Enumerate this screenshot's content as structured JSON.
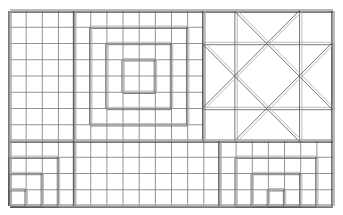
{
  "grid": {
    "cols": 20,
    "rows": 12,
    "x0": 10,
    "y0": 11,
    "cell_w": 16.15,
    "cell_h": 16.25
  },
  "colors": {
    "line": "#555555",
    "light_line": "#aaaaaa",
    "background": "#ffffff"
  },
  "blocks": [
    {
      "name": "left-plain-grid",
      "c0": 0,
      "r0": 0,
      "c1": 4,
      "r1": 8
    },
    {
      "name": "concentric-squares",
      "c0": 4,
      "r0": 0,
      "c1": 12,
      "r1": 8,
      "rings": [
        [
          4,
          0,
          12,
          8
        ],
        [
          5,
          1,
          11,
          7
        ],
        [
          6,
          2,
          10,
          6
        ],
        [
          7,
          3,
          9,
          5
        ]
      ]
    },
    {
      "name": "x-star-block",
      "c0": 12,
      "r0": 0,
      "c1": 20,
      "r1": 8
    },
    {
      "name": "stair-left",
      "c0": 0,
      "r0": 8,
      "c1": 4,
      "r1": 12
    },
    {
      "name": "plain-bottom-middle",
      "c0": 4,
      "r0": 8,
      "c1": 13,
      "r1": 12
    },
    {
      "name": "nested-bottom-right",
      "c0": 13,
      "r0": 8,
      "c1": 20,
      "r1": 12
    }
  ]
}
